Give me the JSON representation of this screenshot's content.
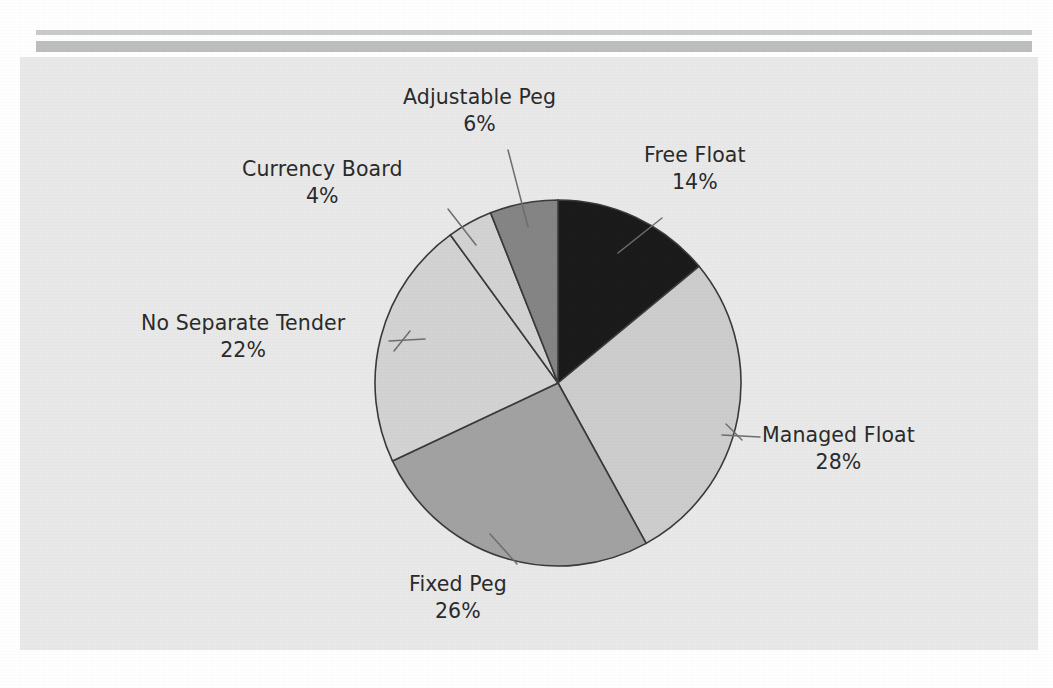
{
  "figure": {
    "background_color": "#ffffff",
    "panel_color": "#e9e9e9",
    "rule_color": "#c4c6c6"
  },
  "chart_data": {
    "type": "pie",
    "title": "",
    "subtitle": "",
    "xlabel": "",
    "ylabel": "",
    "legend_position": "none",
    "grid": false,
    "label_format": "name + percent",
    "start_angle_deg": 0,
    "direction": "clockwise",
    "units": "percent",
    "total": 100,
    "categories": [
      "Free Float",
      "Managed Float",
      "Fixed Peg",
      "No Separate Tender",
      "Currency Board",
      "Adjustable Peg"
    ],
    "values": [
      14,
      28,
      26,
      22,
      4,
      6
    ],
    "slices": [
      {
        "id": "free-float",
        "label": "Free Float",
        "value": 14,
        "value_text": "14%",
        "color": "#1b1b1b",
        "start_deg": 0,
        "end_deg": 50.4,
        "label_align": "left"
      },
      {
        "id": "managed-float",
        "label": "Managed Float",
        "value": 28,
        "value_text": "28%",
        "color": "#cdcdcd",
        "start_deg": 50.4,
        "end_deg": 151.2,
        "label_align": "center"
      },
      {
        "id": "fixed-peg",
        "label": "Fixed Peg",
        "value": 26,
        "value_text": "26%",
        "color": "#a2a2a2",
        "start_deg": 151.2,
        "end_deg": 244.8,
        "label_align": "center"
      },
      {
        "id": "no-separate-tender",
        "label": "No Separate Tender",
        "value": 22,
        "value_text": "22%",
        "color": "#d3d3d3",
        "start_deg": 244.8,
        "end_deg": 324.0,
        "label_align": "center"
      },
      {
        "id": "currency-board",
        "label": "Currency Board",
        "value": 4,
        "value_text": "4%",
        "color": "#d3d3d3",
        "start_deg": 324.0,
        "end_deg": 338.4,
        "label_align": "center"
      },
      {
        "id": "adjustable-peg",
        "label": "Adjustable Peg",
        "value": 6,
        "value_text": "6%",
        "color": "#858585",
        "start_deg": 338.4,
        "end_deg": 360.0,
        "label_align": "center"
      }
    ],
    "geometry": {
      "center_x": 558,
      "center_y": 383,
      "radius": 183,
      "outline_color": "#3a3a3a"
    }
  }
}
